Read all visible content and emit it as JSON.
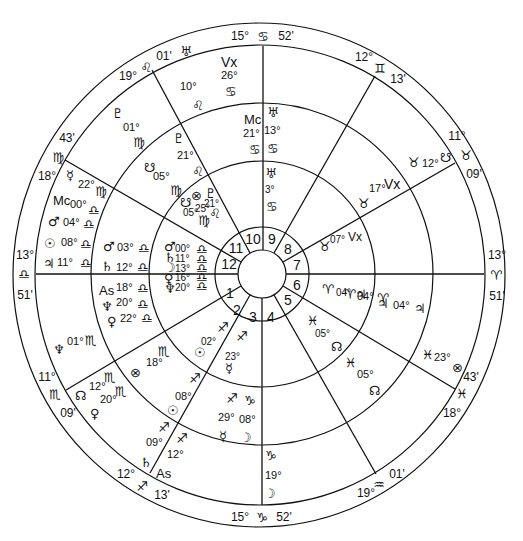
{
  "chart": {
    "type": "astrology-biwheel",
    "colors": {
      "line": "#111111",
      "background": "#ffffff"
    },
    "geometry": {
      "cx": 262,
      "cy": 274,
      "r_outer": 250,
      "r_sign": 228,
      "r_outer_planets": 172,
      "r_inner_planets": 113,
      "r_house_ring": 46,
      "r_center": 24
    },
    "house_numbers": [
      "1",
      "2",
      "3",
      "4",
      "5",
      "6",
      "7",
      "8",
      "9",
      "10",
      "11",
      "12"
    ],
    "outer_cusps": [
      {
        "id": "asc",
        "deg": "13°",
        "sign": "♎",
        "min": "51'"
      },
      {
        "id": "c2",
        "deg": "11°",
        "sign": "♏",
        "min": "09'"
      },
      {
        "id": "c3",
        "deg": "12°",
        "sign": "♐",
        "min": "13'"
      },
      {
        "id": "ic",
        "deg": "15°",
        "sign": "♑",
        "min": "52'"
      },
      {
        "id": "c5",
        "deg": "19°",
        "sign": "♒",
        "min": "01'"
      },
      {
        "id": "c6",
        "deg": "18°",
        "sign": "♓",
        "min": "43'"
      },
      {
        "id": "dsc",
        "deg": "13°",
        "sign": "♈",
        "min": "51'"
      },
      {
        "id": "c8",
        "deg": "11°",
        "sign": "♉",
        "min": "09'"
      },
      {
        "id": "c9",
        "deg": "12°",
        "sign": "♊",
        "min": "13'"
      },
      {
        "id": "mc",
        "deg": "15°",
        "sign": "♋",
        "min": "52'"
      },
      {
        "id": "c11",
        "deg": "19°",
        "sign": "♌",
        "min": "01'"
      },
      {
        "id": "c12",
        "deg": "18°",
        "sign": "♍",
        "min": "43'"
      }
    ],
    "outer_ring_planets": [
      {
        "glyph": "♅",
        "deg": "10°",
        "sign": "♌"
      },
      {
        "glyph": "Vx",
        "deg": "26°",
        "sign": "♋"
      },
      {
        "glyph": "♇",
        "deg": "01°",
        "sign": "♍"
      },
      {
        "glyph": "☿",
        "deg": "22°",
        "sign": "♍"
      },
      {
        "glyph": "Mc",
        "deg": "00°",
        "sign": "♎"
      },
      {
        "glyph": "♂",
        "deg": "04°",
        "sign": "♎"
      },
      {
        "glyph": "☉",
        "deg": "08°",
        "sign": "♎"
      },
      {
        "glyph": "♃",
        "deg": "11°",
        "sign": "♎"
      },
      {
        "glyph": "♆",
        "deg": "01°",
        "sign": "♏"
      },
      {
        "glyph": "☊",
        "deg": "12°",
        "sign": "♏"
      },
      {
        "glyph": "♀",
        "deg": "20°",
        "sign": "♏"
      },
      {
        "glyph": "♄",
        "deg": "09°",
        "sign": "♐"
      },
      {
        "glyph": "As",
        "deg": "12°",
        "sign": "♐"
      },
      {
        "glyph": "☽",
        "deg": "19°",
        "sign": "♑"
      },
      {
        "glyph": "⊗",
        "deg": "23°",
        "sign": "♓"
      },
      {
        "glyph": "♃",
        "deg": "04°",
        "sign": "♈"
      },
      {
        "glyph": "☋",
        "deg": "12°",
        "sign": "♉"
      }
    ],
    "middle_ring_planets": [
      {
        "glyph": "Mc",
        "deg": "21°",
        "sign": "♋"
      },
      {
        "glyph": "♅",
        "deg": "13°",
        "sign": "♋"
      },
      {
        "glyph": "♇",
        "deg": "21°",
        "sign": "♌"
      },
      {
        "glyph": "☋",
        "deg": "05°",
        "sign": "♍"
      },
      {
        "glyph": "♂",
        "deg": "03°",
        "sign": "♎"
      },
      {
        "glyph": "♄",
        "deg": "12°",
        "sign": "♎"
      },
      {
        "glyph": "As",
        "deg": "18°",
        "sign": "♎"
      },
      {
        "glyph": "♆",
        "deg": "20°",
        "sign": "♎"
      },
      {
        "glyph": "♀",
        "deg": "22°",
        "sign": "♎"
      },
      {
        "glyph": "⊗",
        "deg": "18°",
        "sign": "♏"
      },
      {
        "glyph": "☉",
        "deg": "08°",
        "sign": "♐"
      },
      {
        "glyph": "☿",
        "deg": "29°",
        "sign": "♐"
      },
      {
        "glyph": "☽",
        "deg": "08°",
        "sign": "♑"
      },
      {
        "glyph": "☊",
        "deg": "05°",
        "sign": "♓"
      },
      {
        "glyph": "♃",
        "deg": "04°",
        "sign": "♈"
      },
      {
        "glyph": "Vx",
        "deg": "17°",
        "sign": "♉"
      }
    ],
    "inner_ring_planets": [
      {
        "glyph": "♅",
        "deg": "3°",
        "sign": "♋"
      },
      {
        "glyph": "♇",
        "deg": "21°",
        "sign": "♌"
      },
      {
        "glyph": "⊗",
        "deg": "25°",
        "sign": "♌"
      },
      {
        "glyph": "☋",
        "deg": "05°",
        "sign": "♍"
      },
      {
        "glyph": "♂",
        "deg": "00°",
        "sign": "♎"
      },
      {
        "glyph": "♄",
        "deg": "11°",
        "sign": "♎"
      },
      {
        "glyph": "☽",
        "deg": "13°",
        "sign": "♎"
      },
      {
        "glyph": "♀",
        "deg": "16°",
        "sign": "♎"
      },
      {
        "glyph": "♆",
        "deg": "20°",
        "sign": "♎"
      },
      {
        "glyph": "☉",
        "deg": "02°",
        "sign": "♐"
      },
      {
        "glyph": "☿",
        "deg": "23°",
        "sign": "♐"
      },
      {
        "glyph": "☊",
        "deg": "05°",
        "sign": "♓"
      },
      {
        "glyph": "♃",
        "deg": "04°",
        "sign": "♈"
      },
      {
        "glyph": "Vx",
        "deg": "07°",
        "sign": "♉"
      }
    ]
  }
}
